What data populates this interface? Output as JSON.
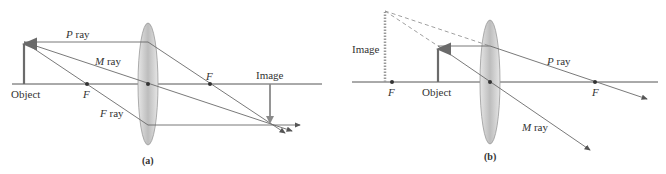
{
  "panel_a": {
    "caption": "(a)",
    "labels": {
      "p_ray": "P",
      "m_ray": "M",
      "f_ray": "F",
      "ray_suffix": " ray",
      "focal_left": "F",
      "focal_right": "F",
      "object": "Object",
      "image": "Image"
    }
  },
  "panel_b": {
    "caption": "(b)",
    "labels": {
      "p_ray": "P",
      "m_ray": "M",
      "ray_suffix": " ray",
      "focal_left": "F",
      "focal_right": "F",
      "object": "Object",
      "image": "Image"
    }
  },
  "colors": {
    "ray": "#6a6a6a",
    "axis": "#555555",
    "object_arrow": "#6b6b6b",
    "image_arrow": "#8a8a8a",
    "lens": "#c8c8c8"
  }
}
